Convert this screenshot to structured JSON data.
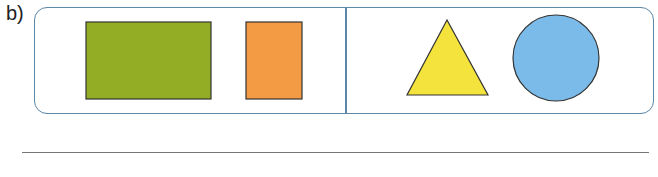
{
  "exercise": {
    "label": "b)",
    "groups": [
      {
        "name": "left",
        "shapes": [
          {
            "type": "rectangle",
            "color": "#93ad24",
            "x": 86,
            "y": 22,
            "width": 125,
            "height": 77
          },
          {
            "type": "rectangle",
            "color": "#f29a44",
            "x": 246,
            "y": 22,
            "width": 56,
            "height": 77
          }
        ]
      },
      {
        "name": "right",
        "shapes": [
          {
            "type": "triangle",
            "color": "#f3e33c",
            "points": "447,20 407,95 488,95"
          },
          {
            "type": "circle",
            "color": "#7bbbe9",
            "cx": 556,
            "cy": 58,
            "r": 43
          }
        ]
      }
    ],
    "border_color": "#5b87a8",
    "answer_line": ""
  }
}
